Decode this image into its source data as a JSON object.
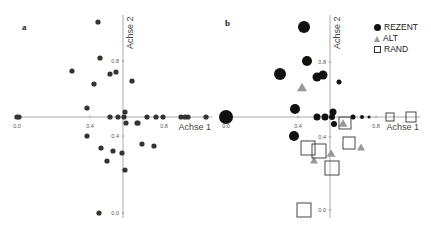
{
  "panels": [
    {
      "id": "a",
      "label": "a",
      "origin_px": {
        "x": 123,
        "y": 117
      },
      "x_axis": {
        "label": "Achse 1",
        "from_px": 14,
        "to_px": 212,
        "ticks": [
          {
            "px": 17,
            "label": "0.0"
          },
          {
            "px": 90,
            "label": "0.4"
          },
          {
            "px": 164,
            "label": "0.8"
          }
        ]
      },
      "y_axis": {
        "label": "Achse 2",
        "from_px": 15,
        "to_px": 218,
        "ticks": [
          {
            "px": 61,
            "label": "0.8"
          },
          {
            "px": 136,
            "label": "0.4"
          },
          {
            "px": 213,
            "label": "0.0"
          }
        ]
      }
    },
    {
      "id": "b",
      "label": "b",
      "origin_px": {
        "x": 330,
        "y": 117
      },
      "x_axis": {
        "label": "Achse 1",
        "from_px": 222,
        "to_px": 420,
        "ticks": [
          {
            "px": 226,
            "label": "0.0"
          },
          {
            "px": 298,
            "label": "0.4"
          },
          {
            "px": 376,
            "label": "0.8"
          }
        ]
      },
      "y_axis": {
        "label": "Achse 2",
        "from_px": 15,
        "to_px": 218,
        "ticks": [
          {
            "px": 62,
            "label": "0.8"
          },
          {
            "px": 137,
            "label": "0.4"
          },
          {
            "px": 210,
            "label": "0.0"
          }
        ]
      }
    }
  ],
  "legend": {
    "items": [
      {
        "symbol": "circle",
        "label": "REZENT"
      },
      {
        "symbol": "triangle",
        "label": "ALT"
      },
      {
        "symbol": "square",
        "label": "RAND"
      }
    ]
  },
  "colors": {
    "rezent": "#111111",
    "alt": "#999999",
    "rand_stroke": "#333333",
    "panel_a_point": "#333333",
    "axis": "#aaaaaa",
    "tick_text": "#555555"
  },
  "chart_data": [
    {
      "type": "scatter",
      "title": "a",
      "xlabel": "Achse 1",
      "ylabel": "Achse 2",
      "x_ticks": [
        "0.0",
        "0.4",
        "0.8"
      ],
      "y_ticks": [
        "0.0",
        "0.4",
        "0.8"
      ],
      "grid": false,
      "series": [
        {
          "name": "samples",
          "marker": "circle",
          "points_px": [
            [
              17,
              117
            ],
            [
              19,
              117
            ],
            [
              98,
              22
            ],
            [
              100,
              58
            ],
            [
              72,
              71
            ],
            [
              110,
              74
            ],
            [
              116,
              72
            ],
            [
              94,
              84
            ],
            [
              132,
              81
            ],
            [
              87,
              108
            ],
            [
              110,
              117
            ],
            [
              118,
              117
            ],
            [
              124,
              117
            ],
            [
              125,
              112
            ],
            [
              126,
              123
            ],
            [
              137,
              123
            ],
            [
              138,
              123
            ],
            [
              147,
              117
            ],
            [
              156,
              117
            ],
            [
              163,
              117
            ],
            [
              181,
              117
            ],
            [
              185,
              117
            ],
            [
              188,
              117
            ],
            [
              206,
              117
            ],
            [
              87,
              136
            ],
            [
              101,
              148
            ],
            [
              113,
              151
            ],
            [
              107,
              161
            ],
            [
              122,
              153
            ],
            [
              125,
              170
            ],
            [
              142,
              144
            ],
            [
              154,
              146
            ],
            [
              99,
              213
            ]
          ]
        }
      ]
    },
    {
      "type": "scatter",
      "title": "b",
      "xlabel": "Achse 1",
      "ylabel": "Achse 2",
      "x_ticks": [
        "0.0",
        "0.4",
        "0.8"
      ],
      "y_ticks": [
        "0.0",
        "0.4",
        "0.8"
      ],
      "grid": false,
      "legend_position": "top-right",
      "series": [
        {
          "name": "REZENT",
          "marker": "circle",
          "points_px": [
            [
              304,
              27,
              6
            ],
            [
              307,
              61,
              5
            ],
            [
              280,
              74,
              6
            ],
            [
              317,
              77,
              4.5
            ],
            [
              323,
              75,
              4.5
            ],
            [
              295,
              109,
              5
            ],
            [
              294,
              136,
              5
            ],
            [
              226,
              117,
              7
            ],
            [
              317,
              117,
              3.5
            ],
            [
              325,
              117,
              3.5
            ],
            [
              332,
              117,
              3
            ],
            [
              333,
              112,
              3.5
            ],
            [
              334,
              124,
              3
            ],
            [
              353,
              117,
              2.5
            ],
            [
              362,
              117,
              2
            ],
            [
              369,
              117,
              1.5
            ],
            [
              339,
              82,
              2.5
            ]
          ]
        },
        {
          "name": "ALT",
          "marker": "triangle",
          "points_px": [
            [
              302,
              87,
              5
            ],
            [
              343,
              123,
              4.5
            ],
            [
              361,
              147,
              4
            ],
            [
              314,
              160,
              4
            ],
            [
              331,
              153,
              4.5
            ]
          ]
        },
        {
          "name": "RAND",
          "marker": "square",
          "points_px": [
            [
              345,
              123,
              6
            ],
            [
              308,
              148,
              7
            ],
            [
              319,
              151,
              7
            ],
            [
              349,
              143,
              6
            ],
            [
              332,
              168,
              7
            ],
            [
              304,
              210,
              7
            ],
            [
              390,
              117,
              4
            ],
            [
              411,
              117,
              5
            ]
          ]
        }
      ]
    }
  ]
}
